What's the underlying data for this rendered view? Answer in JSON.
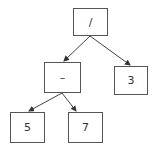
{
  "diagram": {
    "type": "expression-tree",
    "nodes": [
      {
        "id": "root",
        "label": "/",
        "x": 73,
        "y": 8,
        "w": 35,
        "h": 28
      },
      {
        "id": "minus",
        "label": "–",
        "x": 44,
        "y": 62,
        "w": 37,
        "h": 31
      },
      {
        "id": "three",
        "label": "3",
        "x": 114,
        "y": 66,
        "w": 34,
        "h": 29
      },
      {
        "id": "five",
        "label": "5",
        "x": 10,
        "y": 112,
        "w": 35,
        "h": 31
      },
      {
        "id": "seven",
        "label": "7",
        "x": 68,
        "y": 112,
        "w": 35,
        "h": 31
      }
    ],
    "edges": [
      {
        "from": "root",
        "to": "minus"
      },
      {
        "from": "root",
        "to": "three"
      },
      {
        "from": "minus",
        "to": "five"
      },
      {
        "from": "minus",
        "to": "seven"
      }
    ],
    "colors": {
      "line": "#444444",
      "border": "#555555",
      "text": "#333333"
    }
  }
}
